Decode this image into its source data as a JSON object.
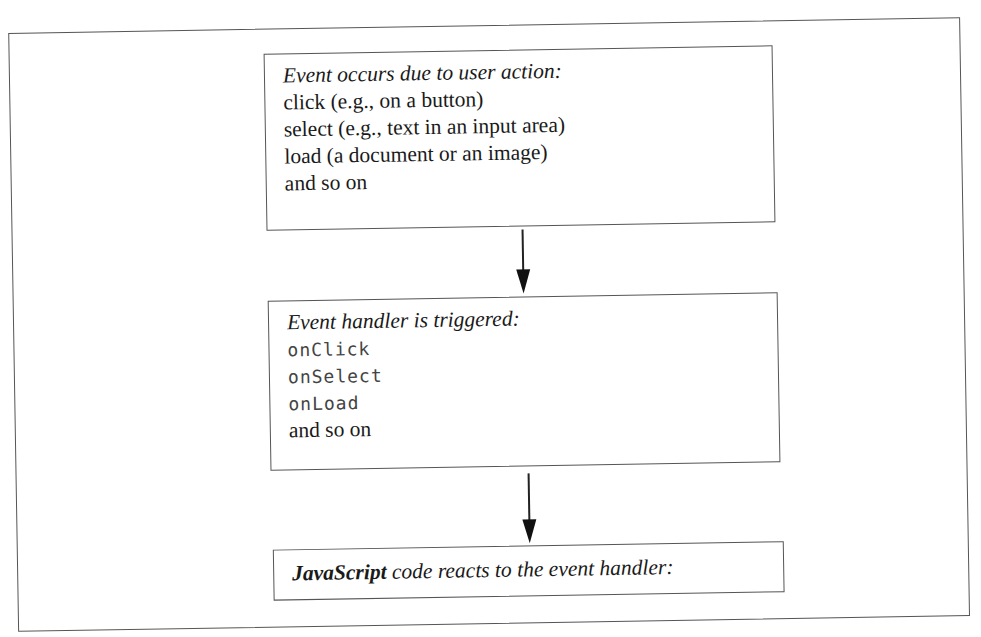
{
  "diagram": {
    "type": "flowchart",
    "direction": "top-to-bottom",
    "steps": [
      {
        "heading": "Event occurs due to user action:",
        "items": [
          "click (e.g., on a button)",
          "select (e.g., text in an input area)",
          "load (a document or an image)",
          "and so on"
        ]
      },
      {
        "heading": "Event handler is triggered:",
        "code_items": [
          "onClick",
          "onSelect",
          "onLoad"
        ],
        "trailing": "and so on"
      },
      {
        "heading_strong": "JavaScript",
        "heading_rest": " code reacts to the event handler:"
      }
    ],
    "connectors": [
      {
        "from": 0,
        "to": 1,
        "style": "arrow-down"
      },
      {
        "from": 1,
        "to": 2,
        "style": "arrow-down"
      }
    ],
    "colors": {
      "border": "#555555",
      "text": "#1a1a1a",
      "code_text": "#444444",
      "arrow": "#111111"
    }
  }
}
